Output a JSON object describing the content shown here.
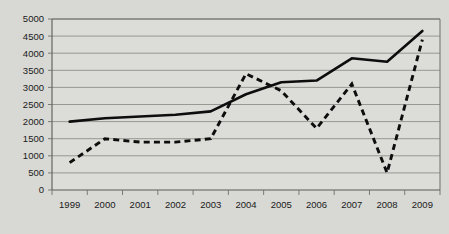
{
  "chart_data": {
    "type": "line",
    "title": "",
    "xlabel": "",
    "ylabel": "",
    "grid": true,
    "legend": "none",
    "categories": [
      "1999",
      "2000",
      "2001",
      "2002",
      "2003",
      "2004",
      "2005",
      "2006",
      "2007",
      "2008",
      "2009"
    ],
    "x": [
      1999,
      2000,
      2001,
      2002,
      2003,
      2004,
      2005,
      2006,
      2007,
      2008,
      2009
    ],
    "ylim": [
      0,
      5000
    ],
    "ytick_values": [
      0,
      500,
      1000,
      1500,
      2000,
      2500,
      3000,
      3500,
      4000,
      4500,
      5000
    ],
    "ytick_labels": [
      "0",
      "500",
      "1000",
      "1500",
      "2000",
      "2500",
      "3000",
      "3500",
      "4000",
      "4500",
      "5000"
    ],
    "series": [
      {
        "name": "solid-series",
        "style": "solid",
        "color": "#0d0d0d",
        "values": [
          2000,
          2100,
          2150,
          2200,
          2300,
          2800,
          3150,
          3200,
          3850,
          3750,
          4650
        ]
      },
      {
        "name": "dashed-series",
        "style": "dashed",
        "color": "#0d0d0d",
        "values": [
          800,
          1500,
          1400,
          1400,
          1500,
          3400,
          2900,
          1800,
          3100,
          500,
          4400
        ]
      }
    ]
  },
  "axis": {
    "y_axis_caption": ""
  }
}
